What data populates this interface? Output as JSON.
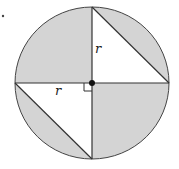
{
  "diagram": {
    "title": "",
    "labels": {
      "vertical_radius": "r",
      "horizontal_radius": "r"
    },
    "colors": {
      "shade": "#d4d4d4",
      "stroke": "#333333",
      "background": "#ffffff"
    }
  }
}
